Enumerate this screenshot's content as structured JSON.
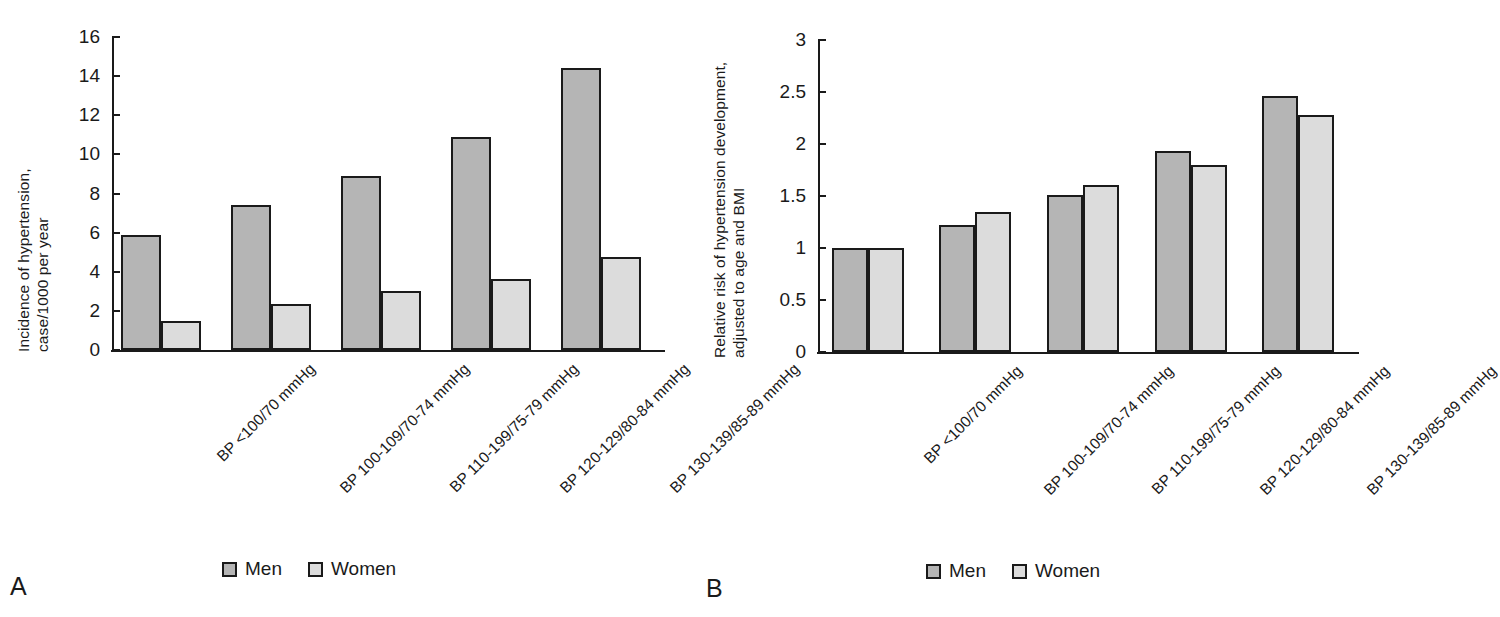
{
  "figure": {
    "panels": [
      {
        "letter": "A",
        "ytitle_line1": "Incidence of hypertension,",
        "ytitle_line2": "case/1000 per year",
        "legend": [
          {
            "label": "Men",
            "color": "#b5b5b5"
          },
          {
            "label": "Women",
            "color": "#dcdcdc"
          }
        ]
      },
      {
        "letter": "B",
        "ytitle_line1": "Relative risk of hypertension development,",
        "ytitle_line2": "adjusted to age and BMI",
        "legend": [
          {
            "label": "Men",
            "color": "#b5b5b5"
          },
          {
            "label": "Women",
            "color": "#dcdcdc"
          }
        ]
      }
    ]
  },
  "chart_data": [
    {
      "type": "bar",
      "panel": "A",
      "title": "",
      "xlabel": "",
      "ylabel": "Incidence of hypertension, case/1000 per year",
      "ylim": [
        0,
        16
      ],
      "yticks": [
        0,
        2,
        4,
        6,
        8,
        10,
        12,
        14,
        16
      ],
      "ytick_labels": [
        "0",
        "2",
        "4",
        "6",
        "8",
        "10",
        "12",
        "14",
        "16"
      ],
      "grid": false,
      "legend_position": "bottom",
      "categories": [
        "BP <100/70 mmHg",
        "BP 100-109/70-74 mmHg",
        "BP 110-199/75-79 mmHg",
        "BP 120-129/80-84 mmHg",
        "BP 130-139/85-89 mmHg"
      ],
      "series": [
        {
          "name": "Men",
          "color": "#b5b5b5",
          "values": [
            5.9,
            7.4,
            8.9,
            10.9,
            14.4
          ]
        },
        {
          "name": "Women",
          "color": "#dcdcdc",
          "values": [
            1.5,
            2.35,
            3.0,
            3.65,
            4.75
          ]
        }
      ]
    },
    {
      "type": "bar",
      "panel": "B",
      "title": "",
      "xlabel": "",
      "ylabel": "Relative risk of hypertension development, adjusted to age and BMI",
      "ylim": [
        0,
        3
      ],
      "yticks": [
        0,
        0.5,
        1,
        1.5,
        2,
        2.5,
        3
      ],
      "ytick_labels": [
        "0",
        "0.5",
        "1",
        "1.5",
        "2",
        "2.5",
        "3"
      ],
      "grid": false,
      "legend_position": "bottom",
      "categories": [
        "BP <100/70 mmHg",
        "BP 100-109/70-74 mmHg",
        "BP 110-199/75-79 mmHg",
        "BP 120-129/80-84 mmHg",
        "BP 130-139/85-89 mmHg"
      ],
      "series": [
        {
          "name": "Men",
          "color": "#b5b5b5",
          "values": [
            1.0,
            1.22,
            1.51,
            1.93,
            2.46
          ]
        },
        {
          "name": "Women",
          "color": "#dcdcdc",
          "values": [
            1.0,
            1.35,
            1.61,
            1.8,
            2.28
          ]
        }
      ]
    }
  ]
}
